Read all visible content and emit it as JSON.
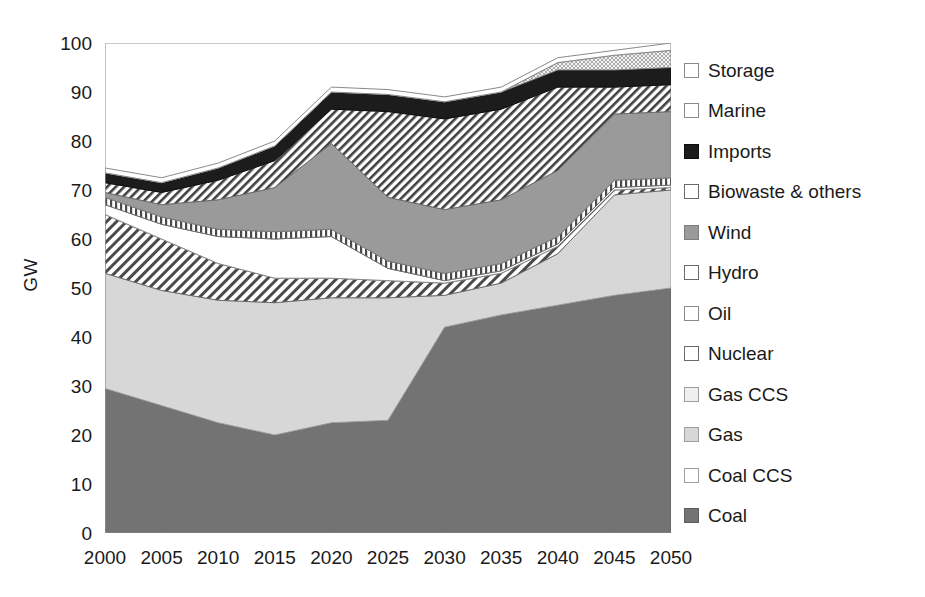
{
  "chart_data": {
    "type": "area",
    "stacked": true,
    "title": "",
    "subtitle": "",
    "xlabel": "",
    "ylabel": "GW",
    "categories": [
      "2000",
      "2005",
      "2010",
      "2015",
      "2020",
      "2025",
      "2030",
      "2035",
      "2040",
      "2045",
      "2050"
    ],
    "x": [
      2000,
      2005,
      2010,
      2015,
      2020,
      2025,
      2030,
      2035,
      2040,
      2045,
      2050
    ],
    "ylim": [
      0,
      100
    ],
    "xlim": [
      2000,
      2050
    ],
    "yticks": [
      0,
      10,
      20,
      30,
      40,
      50,
      60,
      70,
      80,
      90,
      100
    ],
    "ytick_labels": [
      "0",
      "10",
      "20",
      "30",
      "40",
      "50",
      "60",
      "70",
      "80",
      "90",
      "100"
    ],
    "grid": false,
    "legend_position": "right",
    "series": [
      {
        "name": "Coal",
        "pattern": "solid-dark-gray",
        "color": "#737373",
        "values": [
          29.5,
          26.0,
          22.5,
          20.0,
          22.5,
          23.0,
          42.0,
          44.5,
          46.5,
          48.5,
          50.0
        ]
      },
      {
        "name": "Coal CCS",
        "pattern": "light-checker",
        "color": "#dcdcdc",
        "values": [
          0.0,
          0.0,
          0.0,
          0.0,
          0.0,
          0.0,
          0.0,
          0.0,
          0.0,
          0.0,
          0.0
        ]
      },
      {
        "name": "Gas",
        "pattern": "solid-light-gray",
        "color": "#d7d7d7",
        "values": [
          23.5,
          23.5,
          25.0,
          27.0,
          25.5,
          25.0,
          6.5,
          6.5,
          10.5,
          20.5,
          20.0
        ]
      },
      {
        "name": "Gas CCS",
        "pattern": "very-light",
        "color": "#efefef",
        "values": [
          0.0,
          0.0,
          0.0,
          0.0,
          0.0,
          0.0,
          0.0,
          0.0,
          0.0,
          0.0,
          0.0
        ]
      },
      {
        "name": "Nuclear",
        "pattern": "diagonal-hatch",
        "color": "#ffffff",
        "values": [
          12.0,
          10.5,
          7.5,
          5.0,
          4.0,
          3.5,
          2.5,
          2.0,
          1.5,
          1.0,
          0.5
        ]
      },
      {
        "name": "Oil",
        "pattern": "white",
        "color": "#ffffff",
        "values": [
          2.0,
          3.0,
          5.5,
          8.0,
          8.5,
          2.5,
          0.5,
          0.5,
          0.5,
          0.5,
          0.5
        ]
      },
      {
        "name": "Hydro",
        "pattern": "vertical-lines",
        "color": "#ffffff",
        "values": [
          1.5,
          1.5,
          1.5,
          1.5,
          1.5,
          1.5,
          1.5,
          1.5,
          1.5,
          1.5,
          1.5
        ]
      },
      {
        "name": "Wind",
        "pattern": "solid-medium-gray",
        "color": "#9a9a9a",
        "values": [
          1.0,
          2.5,
          6.0,
          9.0,
          17.5,
          13.0,
          13.0,
          13.0,
          13.5,
          13.5,
          13.5
        ]
      },
      {
        "name": "Biowaste & others",
        "pattern": "diagonal-hatch-narrow",
        "color": "#ffffff",
        "values": [
          2.0,
          2.5,
          4.0,
          5.5,
          7.0,
          17.5,
          18.5,
          18.5,
          17.0,
          5.5,
          5.5
        ]
      },
      {
        "name": "Imports",
        "pattern": "solid-black",
        "color": "#1c1c1c",
        "values": [
          2.0,
          2.0,
          2.5,
          3.0,
          3.5,
          3.5,
          3.5,
          3.5,
          3.5,
          3.5,
          3.5
        ]
      },
      {
        "name": "Marine",
        "pattern": "stipple",
        "color": "#cfcfcf",
        "values": [
          0.0,
          0.0,
          0.0,
          0.0,
          0.0,
          0.0,
          0.0,
          0.0,
          1.5,
          3.0,
          3.5
        ]
      },
      {
        "name": "Storage",
        "pattern": "white",
        "color": "#ffffff",
        "values": [
          1.0,
          1.0,
          1.0,
          1.0,
          1.0,
          1.0,
          1.0,
          1.0,
          1.0,
          1.0,
          1.5
        ]
      }
    ],
    "series_totals": [
      77.5,
      75.0,
      79.5,
      84.0,
      94.5,
      90.5,
      89.5,
      91.5,
      96.5,
      97.5,
      100.0
    ],
    "annotations": []
  },
  "legend": {
    "position": "right",
    "entries": [
      {
        "label": "Storage",
        "pattern": "white"
      },
      {
        "label": "Marine",
        "pattern": "stipple"
      },
      {
        "label": "Imports",
        "pattern": "solid-black"
      },
      {
        "label": "Biowaste & others",
        "pattern": "diagonal-hatch-narrow"
      },
      {
        "label": "Wind",
        "pattern": "solid-medium-gray"
      },
      {
        "label": "Hydro",
        "pattern": "vertical-lines"
      },
      {
        "label": "Oil",
        "pattern": "white"
      },
      {
        "label": "Nuclear",
        "pattern": "diagonal-hatch"
      },
      {
        "label": "Gas CCS",
        "pattern": "very-light"
      },
      {
        "label": "Gas",
        "pattern": "solid-light-gray"
      },
      {
        "label": "Coal CCS",
        "pattern": "light-checker"
      },
      {
        "label": "Coal",
        "pattern": "solid-dark-gray"
      }
    ]
  },
  "colors": {
    "axis": "#8c8c8c",
    "text": "#1a1a1a",
    "background": "#ffffff",
    "coal": "#737373",
    "gas": "#d7d7d7",
    "wind": "#9a9a9a",
    "imports": "#1c1c1c",
    "marine": "#cfcfcf"
  }
}
